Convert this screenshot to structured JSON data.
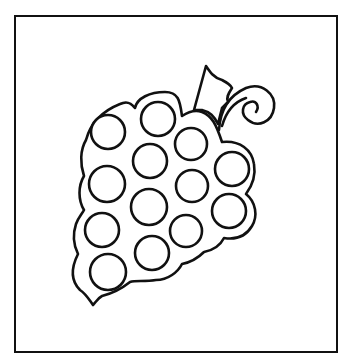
{
  "image": {
    "title": "Grape bunch coloring page",
    "subject": "grapes",
    "background": "#ffffff",
    "stroke_color": "#111111"
  },
  "frame": {
    "x": 14,
    "y": 15,
    "width": 323,
    "height": 337,
    "stroke_width": 2
  },
  "grapes": [
    {
      "cx": 108,
      "cy": 132,
      "r": 17
    },
    {
      "cx": 158,
      "cy": 119,
      "r": 17
    },
    {
      "cx": 191,
      "cy": 144,
      "r": 16
    },
    {
      "cx": 150,
      "cy": 161,
      "r": 17
    },
    {
      "cx": 232,
      "cy": 169,
      "r": 17
    },
    {
      "cx": 107,
      "cy": 184,
      "r": 18
    },
    {
      "cx": 192,
      "cy": 186,
      "r": 16
    },
    {
      "cx": 149,
      "cy": 207,
      "r": 18
    },
    {
      "cx": 229,
      "cy": 211,
      "r": 17
    },
    {
      "cx": 102,
      "cy": 230,
      "r": 17
    },
    {
      "cx": 186,
      "cy": 231,
      "r": 16
    },
    {
      "cx": 152,
      "cy": 253,
      "r": 17
    },
    {
      "cx": 108,
      "cy": 272,
      "r": 18
    }
  ]
}
